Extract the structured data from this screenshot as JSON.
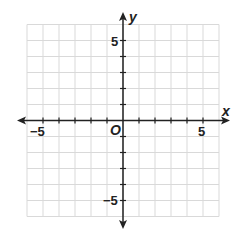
{
  "chart_data": {
    "type": "scatter",
    "title": "",
    "xlabel": "x",
    "ylabel": "y",
    "origin_label": "O",
    "xlim": [
      -6,
      6
    ],
    "ylim": [
      -6,
      6
    ],
    "grid": true,
    "x_tick_labels": [
      "−5",
      "5"
    ],
    "y_tick_labels": [
      "5",
      "−5"
    ],
    "series": []
  }
}
